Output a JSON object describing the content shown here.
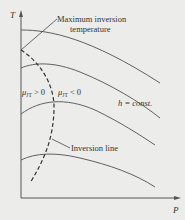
{
  "diagram": {
    "axes": {
      "y_label": "T",
      "x_label": "P"
    },
    "annotations": {
      "max_inversion_line1": "Maximum inversion",
      "max_inversion_line2": "temperature",
      "mu_positive": "μJT > 0",
      "mu_negative": "μJT < 0",
      "mu_symbol": "μ",
      "mu_subscript": "JT",
      "mu_pos_rel": " > 0",
      "mu_neg_rel": " < 0",
      "h_const": "h = const.",
      "inversion_line": "Inversion line"
    },
    "curves": [
      {
        "name": "isenthalp-1"
      },
      {
        "name": "isenthalp-2"
      },
      {
        "name": "isenthalp-3"
      },
      {
        "name": "isenthalp-4"
      }
    ],
    "colors": {
      "background": "#ececea",
      "line": "#555555",
      "text": "#333333"
    }
  }
}
